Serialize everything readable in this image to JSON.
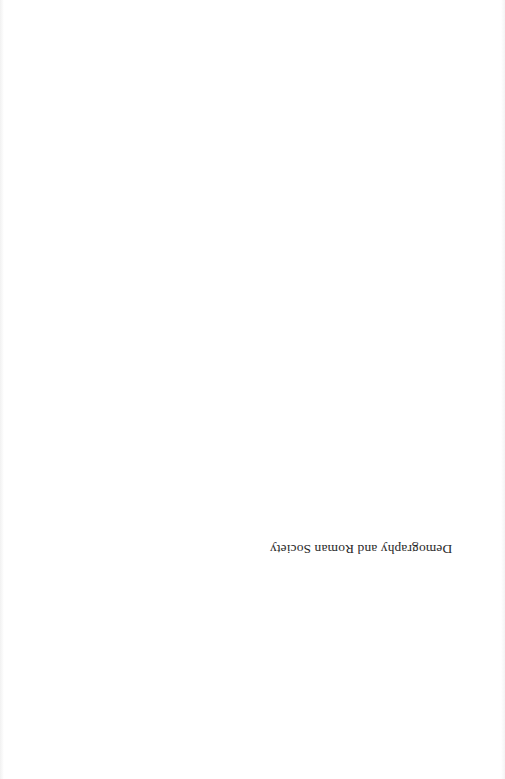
{
  "page": {
    "type": "half-title page",
    "orientation": "rotated 180 degrees",
    "half_title": "Demography and Roman Society"
  }
}
